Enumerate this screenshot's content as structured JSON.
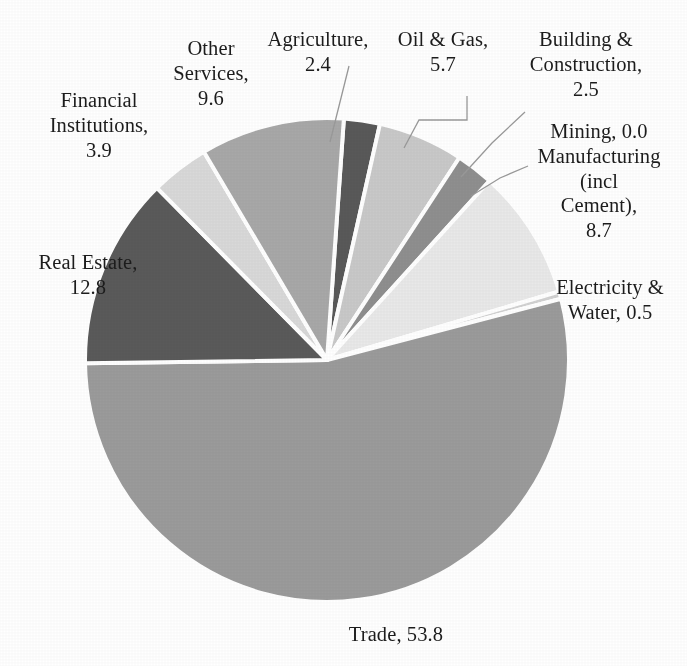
{
  "chart_data": {
    "type": "pie",
    "title": "",
    "subtitle": "",
    "xlabel": "",
    "ylabel": "",
    "legend_position": "none",
    "grid": false,
    "label_format": "{name}, {value}",
    "total": 100.0,
    "categories": [
      "Agriculture",
      "Oil & Gas",
      "Building & Construction",
      "Mining",
      "Manufacturing (incl Cement)",
      "Electricity & Water",
      "Trade",
      "Real Estate",
      "Financial Institutions",
      "Other Services"
    ],
    "values": [
      2.4,
      5.7,
      2.5,
      0.0,
      8.7,
      0.5,
      53.8,
      12.8,
      3.9,
      9.6
    ],
    "slices": [
      {
        "name": "Agriculture",
        "value": 2.4,
        "label": "Agriculture,\n2.4",
        "color": "#595959"
      },
      {
        "name": "Oil & Gas",
        "value": 5.7,
        "label": "Oil & Gas,\n5.7",
        "color": "#c9c9c9"
      },
      {
        "name": "Building & Construction",
        "value": 2.5,
        "label": "Building &\nConstruction,\n2.5",
        "color": "#8f8f8f"
      },
      {
        "name": "Mining",
        "value": 0.0,
        "label": "Mining,  0.0",
        "color": "#767676"
      },
      {
        "name": "Manufacturing (incl Cement)",
        "value": 8.7,
        "label": "Manufacturing\n(incl\nCement),\n8.7",
        "color": "#e9e9e9"
      },
      {
        "name": "Electricity & Water",
        "value": 0.5,
        "label": "Electricity &\nWater,  0.5",
        "color": "#d2d2d2"
      },
      {
        "name": "Trade",
        "value": 53.8,
        "label": "Trade, 53.8",
        "color": "#9b9b9b"
      },
      {
        "name": "Real Estate",
        "value": 12.8,
        "label": "Real Estate,\n12.8",
        "color": "#5a5a5a"
      },
      {
        "name": "Financial Institutions",
        "value": 3.9,
        "label": "Financial\nInstitutions,\n3.9",
        "color": "#d9d9d9"
      },
      {
        "name": "Other Services",
        "value": 9.6,
        "label": "Other\nServices,\n9.6",
        "color": "#a8a8a8"
      }
    ]
  },
  "labels": {
    "agriculture": "Agriculture,\n2.4",
    "oil_gas": "Oil & Gas,\n5.7",
    "building_construction": "Building &\nConstruction,\n2.5",
    "mining_manufacturing": "Mining,  0.0\nManufacturing\n(incl\nCement),\n8.7",
    "other_services": "Other\nServices,\n9.6",
    "financial_institutions": "Financial\nInstitutions,\n3.9",
    "real_estate": "Real Estate,\n12.8",
    "electricity_water": "Electricity &\nWater,  0.5",
    "trade": "Trade, 53.8"
  },
  "style": {
    "background": "#ffffff",
    "separator_color": "#ffffff",
    "text_color": "#1c1c1c",
    "leader_line_color": "#9a9a9a"
  },
  "geometry": {
    "center_x": 327,
    "center_y": 360,
    "radius": 242,
    "start_angle_deg": -86
  }
}
